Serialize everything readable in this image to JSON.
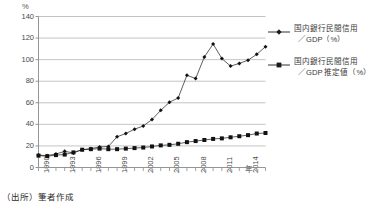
{
  "chart_data": {
    "type": "line",
    "title": "",
    "subtitle": "",
    "xlabel": "年",
    "ylabel": "%",
    "ylim": [
      0,
      140
    ],
    "ytick_values": [
      0,
      20,
      40,
      60,
      80,
      100,
      120,
      140
    ],
    "ytick_labels": [
      "0",
      "20",
      "40",
      "60",
      "80",
      "100",
      "120",
      "140"
    ],
    "grid": "horizontal",
    "legend_position": "right",
    "x": [
      1990,
      1991,
      1992,
      1993,
      1994,
      1995,
      1996,
      1997,
      1998,
      1999,
      2000,
      2001,
      2002,
      2003,
      2004,
      2005,
      2006,
      2007,
      2008,
      2009,
      2010,
      2011,
      2012,
      2013,
      2014,
      2015,
      2016
    ],
    "xtick_labels": [
      "1990",
      "1993",
      "1996",
      "1999",
      "2002",
      "2005",
      "2008",
      "2011",
      "2014"
    ],
    "xtick_values": [
      1990,
      1993,
      1996,
      1999,
      2002,
      2005,
      2008,
      2011,
      2014
    ],
    "series": [
      {
        "name": "国内銀行民間信用／GDP（%）",
        "marker": "diamond",
        "values": [
          11.5,
          11.0,
          12.5,
          15.0,
          13.5,
          16.5,
          17.5,
          19.0,
          19.5,
          28.5,
          31.5,
          35.5,
          38.5,
          44.5,
          53.0,
          60.5,
          64.5,
          85.5,
          82.5,
          102.5,
          114.5,
          101.0,
          94.0,
          96.5,
          99.5,
          105.0,
          112.0
        ]
      },
      {
        "name": "国内銀行民間信用／GDP 推定値（%）",
        "marker": "square",
        "values": [
          11.0,
          10.5,
          11.5,
          12.0,
          14.0,
          16.5,
          17.0,
          17.5,
          17.0,
          17.0,
          17.5,
          18.0,
          18.5,
          19.5,
          20.5,
          21.0,
          22.0,
          23.5,
          24.5,
          25.5,
          26.5,
          27.0,
          28.0,
          29.0,
          30.0,
          31.5,
          32.0
        ]
      }
    ]
  },
  "legend": {
    "entries": [
      {
        "line1": "国内銀行民間信用",
        "line2": "／GDP（%）",
        "marker": "diamond"
      },
      {
        "line1": "国内銀行民間信用",
        "line2": "／GDP 推定値（%）",
        "marker": "square"
      }
    ]
  },
  "axis": {
    "y_unit": "%",
    "x_unit": "年"
  },
  "source_note": "（出所）筆者作成",
  "colors": {
    "series_1": "#1a1a1a",
    "series_2": "#1a1a1a",
    "grid": "#a9a9a9",
    "axis": "#8a8a8a",
    "text": "#3a3a3a"
  }
}
